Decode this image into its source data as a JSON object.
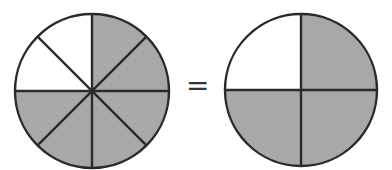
{
  "diagram": {
    "title": "",
    "left_circle": {
      "segments_total": 8,
      "segments_shaded": 6,
      "fraction": "6/8",
      "unshaded_positions": [
        "upper-left-top",
        "upper-left-bottom"
      ]
    },
    "operator": "=",
    "right_circle": {
      "segments_total": 4,
      "segments_shaded": 3,
      "fraction": "3/4",
      "unshaded_positions": [
        "upper-left"
      ]
    },
    "colors": {
      "shaded": "#a8a8a8",
      "unshaded": "#ffffff",
      "stroke": "#2a2a2a"
    }
  }
}
